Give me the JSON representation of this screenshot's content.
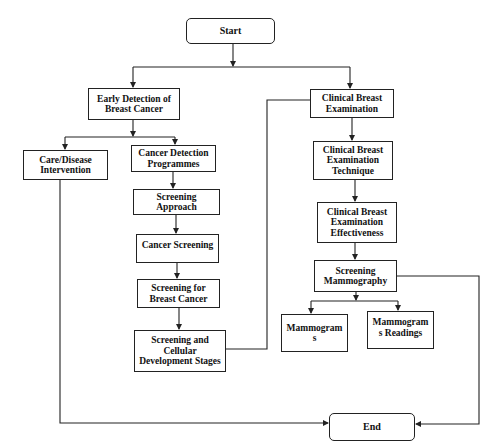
{
  "diagram": {
    "type": "flowchart",
    "nodes": [
      {
        "id": "start",
        "label": "Start",
        "shape": "rounded"
      },
      {
        "id": "early_detection",
        "label": "Early Detection of\nBreast Cancer",
        "shape": "rect"
      },
      {
        "id": "clinical_exam",
        "label": "Clinical Breast\nExamination",
        "shape": "rect"
      },
      {
        "id": "care_intervention",
        "label": "Care/Disease\nIntervention",
        "shape": "rect"
      },
      {
        "id": "cancer_detection_programmes",
        "label": "Cancer Detection\nProgrammes",
        "shape": "rect"
      },
      {
        "id": "screening_approach",
        "label": "Screening\nApproach",
        "shape": "rect"
      },
      {
        "id": "cancer_screening",
        "label": "Cancer Screening",
        "shape": "rect"
      },
      {
        "id": "screening_breast_cancer",
        "label": "Screening for\nBreast Cancer",
        "shape": "rect"
      },
      {
        "id": "screening_cellular",
        "label": "Screening and\nCellular\nDevelopment Stages",
        "shape": "rect"
      },
      {
        "id": "exam_technique",
        "label": "Clinical Breast\nExamination\nTechnique",
        "shape": "rect"
      },
      {
        "id": "exam_effectiveness",
        "label": "Clinical Breast\nExamination\nEffectiveness",
        "shape": "rect"
      },
      {
        "id": "screening_mammography",
        "label": "Screening\nMammography",
        "shape": "rect"
      },
      {
        "id": "mammograms",
        "label": "Mammogram\ns",
        "shape": "rect"
      },
      {
        "id": "mammogram_readings",
        "label": "Mammogram\ns Readings",
        "shape": "rect"
      },
      {
        "id": "end",
        "label": "End",
        "shape": "rounded"
      }
    ],
    "edges": [
      {
        "from": "start",
        "to": "early_detection"
      },
      {
        "from": "start",
        "to": "clinical_exam"
      },
      {
        "from": "early_detection",
        "to": "care_intervention"
      },
      {
        "from": "early_detection",
        "to": "cancer_detection_programmes"
      },
      {
        "from": "cancer_detection_programmes",
        "to": "screening_approach"
      },
      {
        "from": "screening_approach",
        "to": "cancer_screening"
      },
      {
        "from": "cancer_screening",
        "to": "screening_breast_cancer"
      },
      {
        "from": "screening_breast_cancer",
        "to": "screening_cellular"
      },
      {
        "from": "screening_cellular",
        "to": "clinical_exam"
      },
      {
        "from": "clinical_exam",
        "to": "exam_technique"
      },
      {
        "from": "exam_technique",
        "to": "exam_effectiveness"
      },
      {
        "from": "exam_effectiveness",
        "to": "screening_mammography"
      },
      {
        "from": "screening_mammography",
        "to": "mammograms"
      },
      {
        "from": "screening_mammography",
        "to": "mammogram_readings"
      },
      {
        "from": "screening_mammography",
        "to": "end"
      },
      {
        "from": "care_intervention",
        "to": "end"
      }
    ]
  },
  "labels": {
    "start": "Start",
    "early_detection": "Early Detection of\nBreast Cancer",
    "clinical_exam": "Clinical Breast\nExamination",
    "care_intervention": "Care/Disease\nIntervention",
    "cancer_detection_programmes": "Cancer Detection\nProgrammes",
    "screening_approach": "Screening\nApproach",
    "cancer_screening": "Cancer Screening",
    "screening_breast_cancer": "Screening for\nBreast Cancer",
    "screening_cellular": "Screening and\nCellular\nDevelopment Stages",
    "exam_technique": "Clinical Breast\nExamination\nTechnique",
    "exam_effectiveness": "Clinical Breast\nExamination\nEffectiveness",
    "screening_mammography": "Screening\nMammography",
    "mammograms": "Mammogram\ns",
    "mammogram_readings": "Mammogram\ns Readings",
    "end": "End"
  },
  "colors": {
    "line": "#222222",
    "box_border": "#222222",
    "background": "#ffffff",
    "text": "#111111"
  }
}
